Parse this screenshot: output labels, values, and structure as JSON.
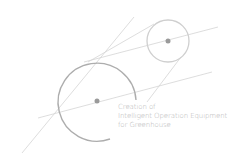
{
  "caption": {
    "line1": "Creation of",
    "line2": "Intelligent Operation Equipment",
    "line3": "for Greenhouse"
  },
  "colors": {
    "line": "#d4d4d4",
    "circle": "#c8c8c8",
    "big_arc": "#aaaaaa",
    "dot": "#9a9a9a",
    "text": "#b4b4b4"
  }
}
